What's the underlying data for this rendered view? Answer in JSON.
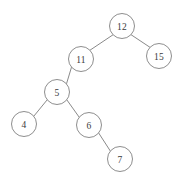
{
  "diagram": {
    "kind": "binary-search-tree",
    "canvas": {
      "width": 179,
      "height": 183,
      "background": "#ffffff"
    },
    "style": {
      "node_radius": 12.5,
      "node_fill": "#ffffff",
      "node_stroke": "#8e8e8e",
      "edge_stroke": "#8a8a8a",
      "label_color": "#3a3a3a"
    },
    "nodes": [
      {
        "id": "n12",
        "label": "12",
        "cx": 122,
        "cy": 26,
        "r": 12.5,
        "role": "root"
      },
      {
        "id": "n15",
        "label": "15",
        "cx": 159,
        "cy": 56,
        "r": 12.5,
        "role": "leaf"
      },
      {
        "id": "n11",
        "label": "11",
        "cx": 81,
        "cy": 59,
        "r": 12.5,
        "role": "internal"
      },
      {
        "id": "n5",
        "label": "5",
        "cx": 57,
        "cy": 92,
        "r": 12.5,
        "role": "internal"
      },
      {
        "id": "n4",
        "label": "4",
        "cx": 24,
        "cy": 124,
        "r": 12.5,
        "role": "leaf"
      },
      {
        "id": "n6",
        "label": "6",
        "cx": 89,
        "cy": 125,
        "r": 12.5,
        "role": "internal"
      },
      {
        "id": "n7",
        "label": "7",
        "cx": 120,
        "cy": 159,
        "r": 12.5,
        "role": "leaf"
      }
    ],
    "edges": [
      {
        "id": "e-12-11",
        "from": "n12",
        "to": "n11",
        "side": "left",
        "x1": 113.0,
        "y1": 34.8,
        "x2": 90.0,
        "y2": 50.2
      },
      {
        "id": "e-12-15",
        "from": "n12",
        "to": "n15",
        "side": "right",
        "x1": 130.0,
        "y1": 34.0,
        "x2": 151.0,
        "y2": 48.0
      },
      {
        "id": "e-11-5",
        "from": "n11",
        "to": "n5",
        "side": "left",
        "x1": 71.5,
        "y1": 67.2,
        "x2": 66.5,
        "y2": 83.8
      },
      {
        "id": "e-5-4",
        "from": "n5",
        "to": "n4",
        "side": "left",
        "x1": 47.2,
        "y1": 99.8,
        "x2": 33.8,
        "y2": 116.2
      },
      {
        "id": "e-5-6",
        "from": "n5",
        "to": "n6",
        "side": "right",
        "x1": 66.8,
        "y1": 99.8,
        "x2": 79.2,
        "y2": 117.2
      },
      {
        "id": "e-6-7",
        "from": "n6",
        "to": "n7",
        "side": "right",
        "x1": 98.8,
        "y1": 133.2,
        "x2": 110.2,
        "y2": 150.8
      }
    ]
  }
}
